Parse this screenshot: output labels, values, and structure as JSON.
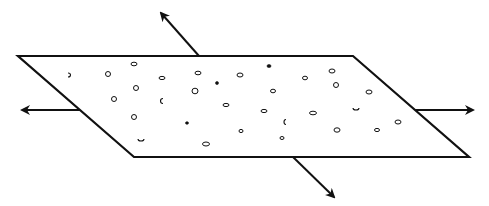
{
  "diagram": {
    "width": 489,
    "height": 206,
    "stroke_color": "#111111",
    "background": "#ffffff",
    "plane": {
      "points": [
        [
          18,
          56
        ],
        [
          353,
          56
        ],
        [
          469,
          157
        ],
        [
          134,
          157
        ]
      ],
      "stroke_width": 2.2
    },
    "arrows": [
      {
        "name": "arrow-up-left",
        "from": [
          199,
          56
        ],
        "to": [
          161,
          13
        ]
      },
      {
        "name": "arrow-left",
        "from": [
          80,
          110
        ],
        "to": [
          22,
          110
        ]
      },
      {
        "name": "arrow-right",
        "from": [
          415,
          110
        ],
        "to": [
          473,
          110
        ]
      },
      {
        "name": "arrow-down-right",
        "from": [
          293,
          157
        ],
        "to": [
          334,
          197
        ]
      }
    ],
    "particles": [
      {
        "x": 68,
        "y": 75,
        "rx": 2.5,
        "ry": 2,
        "shape": "arc-right"
      },
      {
        "x": 108,
        "y": 74,
        "rx": 2.5,
        "ry": 2.5,
        "shape": "ring"
      },
      {
        "x": 134,
        "y": 64,
        "rx": 3,
        "ry": 1.8,
        "shape": "ring"
      },
      {
        "x": 136,
        "y": 88,
        "rx": 2.5,
        "ry": 2.5,
        "shape": "ring"
      },
      {
        "x": 114,
        "y": 99,
        "rx": 2.5,
        "ry": 2.5,
        "shape": "ring"
      },
      {
        "x": 163,
        "y": 101,
        "rx": 2.5,
        "ry": 2.5,
        "shape": "arc-left"
      },
      {
        "x": 162,
        "y": 78,
        "rx": 3,
        "ry": 1.6,
        "shape": "ring"
      },
      {
        "x": 198,
        "y": 73,
        "rx": 3,
        "ry": 1.8,
        "shape": "ring"
      },
      {
        "x": 217,
        "y": 83,
        "rx": 1.5,
        "ry": 1.5,
        "shape": "dot"
      },
      {
        "x": 240,
        "y": 75,
        "rx": 3,
        "ry": 2,
        "shape": "ring"
      },
      {
        "x": 195,
        "y": 91,
        "rx": 3,
        "ry": 2.8,
        "shape": "ring"
      },
      {
        "x": 226,
        "y": 105,
        "rx": 3,
        "ry": 1.6,
        "shape": "ring"
      },
      {
        "x": 269,
        "y": 66,
        "rx": 2,
        "ry": 1.5,
        "shape": "dot"
      },
      {
        "x": 273,
        "y": 91,
        "rx": 2.5,
        "ry": 1.8,
        "shape": "ring"
      },
      {
        "x": 305,
        "y": 78,
        "rx": 2.5,
        "ry": 1.8,
        "shape": "ring"
      },
      {
        "x": 332,
        "y": 71,
        "rx": 3,
        "ry": 2,
        "shape": "ring"
      },
      {
        "x": 336,
        "y": 85,
        "rx": 2.5,
        "ry": 2.5,
        "shape": "ring"
      },
      {
        "x": 369,
        "y": 92,
        "rx": 3,
        "ry": 2,
        "shape": "ring"
      },
      {
        "x": 134,
        "y": 117,
        "rx": 2.5,
        "ry": 2.5,
        "shape": "ring"
      },
      {
        "x": 187,
        "y": 123,
        "rx": 1.5,
        "ry": 1.3,
        "shape": "dot"
      },
      {
        "x": 141,
        "y": 139,
        "rx": 3,
        "ry": 2,
        "shape": "arc-bottom"
      },
      {
        "x": 206,
        "y": 144,
        "rx": 3.5,
        "ry": 2,
        "shape": "ring"
      },
      {
        "x": 241,
        "y": 131,
        "rx": 2,
        "ry": 1.6,
        "shape": "ring"
      },
      {
        "x": 264,
        "y": 111,
        "rx": 3,
        "ry": 1.6,
        "shape": "ring"
      },
      {
        "x": 313,
        "y": 113,
        "rx": 3.5,
        "ry": 1.8,
        "shape": "ring"
      },
      {
        "x": 286,
        "y": 122,
        "rx": 2,
        "ry": 2.5,
        "shape": "arc-left"
      },
      {
        "x": 282,
        "y": 138,
        "rx": 2,
        "ry": 1.5,
        "shape": "ring"
      },
      {
        "x": 337,
        "y": 130,
        "rx": 3,
        "ry": 2.2,
        "shape": "ring"
      },
      {
        "x": 377,
        "y": 130,
        "rx": 2.5,
        "ry": 1.6,
        "shape": "ring"
      },
      {
        "x": 356,
        "y": 108,
        "rx": 3,
        "ry": 2,
        "shape": "arc-bottom"
      },
      {
        "x": 398,
        "y": 122,
        "rx": 3,
        "ry": 2,
        "shape": "ring"
      }
    ]
  }
}
